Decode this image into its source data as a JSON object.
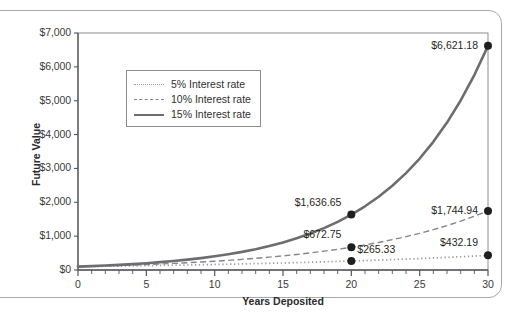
{
  "chart_data": {
    "type": "line",
    "title": "",
    "xlabel": "Years Deposited",
    "ylabel": "Future Value",
    "xlim": [
      0,
      30
    ],
    "ylim": [
      0,
      7000
    ],
    "grid": false,
    "legend_position": "upper-left-inside",
    "x_ticks": [
      0,
      5,
      10,
      15,
      20,
      25,
      30
    ],
    "x_tick_labels": [
      "0",
      "5",
      "10",
      "15",
      "20",
      "25",
      "30"
    ],
    "x_minor_tick_step": 1,
    "y_ticks": [
      0,
      1000,
      2000,
      3000,
      4000,
      5000,
      6000,
      7000
    ],
    "y_tick_labels": [
      "$0",
      "$1,000",
      "$2,000",
      "$3,000",
      "$4,000",
      "$5,000",
      "$6,000",
      "$7,000"
    ],
    "principal": 100,
    "x": [
      0,
      1,
      2,
      3,
      4,
      5,
      6,
      7,
      8,
      9,
      10,
      11,
      12,
      13,
      14,
      15,
      16,
      17,
      18,
      19,
      20,
      21,
      22,
      23,
      24,
      25,
      26,
      27,
      28,
      29,
      30
    ],
    "series": [
      {
        "name": "5% Interest rate",
        "rate": 0.05,
        "style": "dotted",
        "color": "#9a9a9e",
        "values": [
          100,
          105,
          110.25,
          115.76,
          121.55,
          127.63,
          134.01,
          140.71,
          147.75,
          155.13,
          162.89,
          171.03,
          179.59,
          188.56,
          197.99,
          207.89,
          218.29,
          229.2,
          240.66,
          252.7,
          265.33,
          278.6,
          292.53,
          307.15,
          322.51,
          338.64,
          355.57,
          373.35,
          392.01,
          411.61,
          432.19
        ],
        "labeled_points": [
          {
            "x": 20,
            "y": 265.33,
            "label": "$265.33"
          },
          {
            "x": 30,
            "y": 432.19,
            "label": "$432.19"
          }
        ]
      },
      {
        "name": "10% Interest rate",
        "rate": 0.1,
        "style": "dashed",
        "color": "#86868a",
        "values": [
          100,
          110,
          121,
          133.1,
          146.41,
          161.05,
          177.16,
          194.87,
          214.36,
          235.79,
          259.37,
          285.31,
          313.84,
          345.23,
          379.75,
          417.72,
          459.5,
          505.45,
          555.99,
          611.59,
          672.75,
          740.02,
          814.03,
          895.43,
          984.97,
          1083.47,
          1191.82,
          1311,
          1442.1,
          1586.31,
          1744.94
        ],
        "labeled_points": [
          {
            "x": 20,
            "y": 672.75,
            "label": "$672.75"
          },
          {
            "x": 30,
            "y": 1744.94,
            "label": "$1,744.94"
          }
        ]
      },
      {
        "name": "15% Interest rate",
        "rate": 0.15,
        "style": "solid",
        "color": "#6d6d71",
        "values": [
          100,
          115,
          132.25,
          152.09,
          174.9,
          201.14,
          231.31,
          266.0,
          305.9,
          351.79,
          404.56,
          465.24,
          535.03,
          615.28,
          707.57,
          813.71,
          935.76,
          1076.13,
          1237.55,
          1423.18,
          1636.65,
          1882.15,
          2164.47,
          2489.14,
          2862.52,
          3291.9,
          3785.68,
          4353.53,
          5006.56,
          5757.55,
          6621.18
        ],
        "labeled_points": [
          {
            "x": 20,
            "y": 1636.65,
            "label": "$1,636.65"
          },
          {
            "x": 30,
            "y": 6621.18,
            "label": "$6,621.18"
          }
        ]
      }
    ],
    "legend_entries": [
      "5% Interest rate",
      "10% Interest rate",
      "15% Interest rate"
    ],
    "annotations": [
      {
        "label": "$6,621.18",
        "x": 30,
        "y": 6621.18
      },
      {
        "label": "$1,636.65",
        "x": 20,
        "y": 1636.65
      },
      {
        "label": "$1,744.94",
        "x": 30,
        "y": 1744.94
      },
      {
        "label": "$672.75",
        "x": 20,
        "y": 672.75
      },
      {
        "label": "$265.33",
        "x": 20,
        "y": 265.33
      },
      {
        "label": "$432.19",
        "x": 30,
        "y": 432.19
      }
    ],
    "colors": {
      "axis": "#55555a",
      "text": "#2f2f31",
      "marker": "#1f1f21",
      "card_border": "#a9a9ad",
      "background": "#ffffff"
    }
  }
}
